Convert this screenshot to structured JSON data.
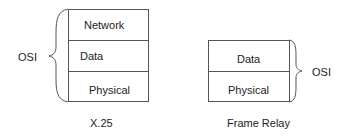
{
  "diagrams": [
    {
      "caption": "X.25",
      "brace_label": "OSI",
      "layers": [
        {
          "label": "Network"
        },
        {
          "label": "Data"
        },
        {
          "label": "Physical"
        }
      ]
    },
    {
      "caption": "Frame Relay",
      "brace_label": "OSI",
      "layers": [
        {
          "label": "Data"
        },
        {
          "label": "Physical"
        }
      ]
    }
  ]
}
